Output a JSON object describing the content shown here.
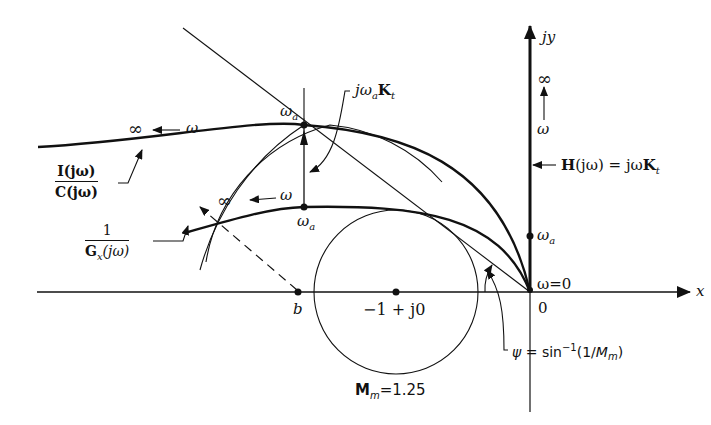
{
  "figure": {
    "axes": {
      "x_label": "x",
      "y_label": "jy",
      "origin_label": "0"
    },
    "points": {
      "b_label": "b",
      "minus_one_label": "−1 + j0",
      "omega_zero_label": "ω=0",
      "omega_a_axis_label": "ω",
      "omega_a_axis_sub": "a"
    },
    "curves": {
      "ic_num": "I(jω)",
      "ic_den": "C(jω)",
      "gx_num": "1",
      "gx_den_main": "G",
      "gx_den_sub": "x",
      "gx_den_tail": "(jω)",
      "top_direction": {
        "infinity": "∞",
        "omega": "ω"
      },
      "lower_direction": {
        "infinity": "∞",
        "omega": "ω"
      },
      "upper_omega_a": {
        "main": "ω",
        "sub": "a"
      },
      "lower_omega_a": {
        "main": "ω",
        "sub": "a"
      }
    },
    "annotations": {
      "jwaKt": {
        "j": "jω",
        "sub_a": "a",
        "K": "K",
        "sub_t": "t"
      },
      "H_label": {
        "H": "H",
        "rest": "(jω) = jω",
        "K": "K",
        "sub_t": "t"
      },
      "yaxis_infinity": "∞",
      "yaxis_omega": "ω",
      "psi_label": {
        "psi": "ψ",
        "eq": " = sin",
        "sup": "−1",
        "paren": "(1/",
        "M": "M",
        "sub": "m",
        "close": ")"
      },
      "Mm_label": {
        "M": "M",
        "sub": "m",
        "value": "=1.25"
      }
    },
    "colors": {
      "ink": "#111111",
      "background": "#ffffff"
    }
  }
}
